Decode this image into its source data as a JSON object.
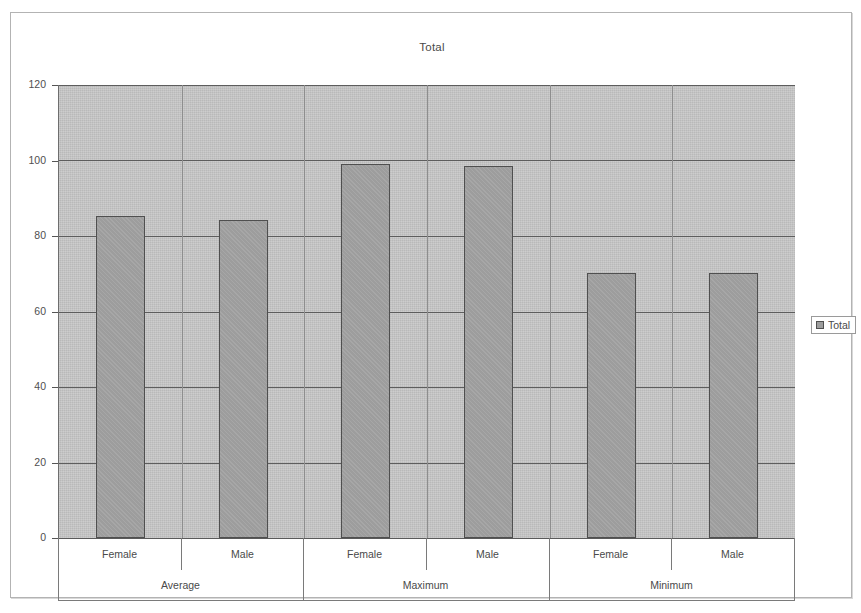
{
  "window": {
    "frame_border_color": "#b3b3b3",
    "background": "#ffffff"
  },
  "legend": {
    "position": "right",
    "entries": [
      {
        "label": "Total",
        "swatch_color": "#9d9d9d",
        "icon": "square-swatch-icon"
      }
    ]
  },
  "axes": {
    "y_ticks": [
      "0",
      "20",
      "40",
      "60",
      "80",
      "100",
      "120"
    ],
    "x_group_labels": [
      "Average",
      "Maximum",
      "Minimum"
    ],
    "x_sub_labels": [
      "Female",
      "Male",
      "Female",
      "Male",
      "Female",
      "Male"
    ]
  },
  "chart_data": {
    "type": "bar",
    "title": "Total",
    "xlabel": "",
    "ylabel": "",
    "ylim": [
      0,
      120
    ],
    "ytick_step": 20,
    "grid": true,
    "legend_position": "right",
    "plot_background": "#b9b9b9",
    "bar_fill": "#9d9d9d",
    "bar_border": "#4f4f4f",
    "categories": [
      "Average - Female",
      "Average - Male",
      "Maximum - Female",
      "Maximum - Male",
      "Minimum - Female",
      "Minimum - Male"
    ],
    "groups": [
      {
        "name": "Average",
        "subcategories": [
          "Female",
          "Male"
        ]
      },
      {
        "name": "Maximum",
        "subcategories": [
          "Female",
          "Male"
        ]
      },
      {
        "name": "Minimum",
        "subcategories": [
          "Female",
          "Male"
        ]
      }
    ],
    "series": [
      {
        "name": "Total",
        "values": [
          85.3,
          84.2,
          99.2,
          98.5,
          70.2,
          70.3
        ]
      }
    ]
  }
}
